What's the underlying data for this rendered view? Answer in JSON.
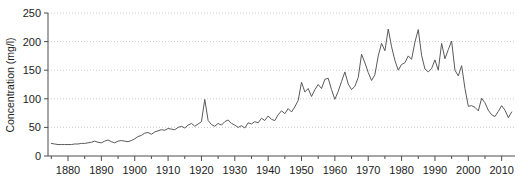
{
  "chart_data": {
    "type": "line",
    "title": "",
    "xlabel": "",
    "ylabel": "Concentration (mg/l)",
    "xlim": [
      1874,
      2014
    ],
    "ylim": [
      0,
      250
    ],
    "yticks": [
      0,
      50,
      100,
      150,
      200,
      250
    ],
    "ytick_labels": [
      "0",
      "50",
      "100",
      "150",
      "200",
      "250"
    ],
    "xticks": [
      1880,
      1890,
      1900,
      1910,
      1920,
      1930,
      1940,
      1950,
      1960,
      1970,
      1980,
      1990,
      2000,
      2010
    ],
    "xtick_labels": [
      "1880",
      "1890",
      "1900",
      "1910",
      "1920",
      "1930",
      "1940",
      "1950",
      "1960",
      "1970",
      "1980",
      "1990",
      "2000",
      "2010"
    ],
    "xminor_step": 5,
    "grid": "horizontal-dotted",
    "grid_color": "#cccccc",
    "legend": "none",
    "line_color": "#5a5a5a",
    "line_width": 1,
    "axis_color": "#4d4d4d",
    "background": "#ffffff",
    "x": [
      1875,
      1876,
      1877,
      1878,
      1879,
      1880,
      1881,
      1882,
      1883,
      1884,
      1885,
      1886,
      1887,
      1888,
      1889,
      1890,
      1891,
      1892,
      1893,
      1894,
      1895,
      1896,
      1897,
      1898,
      1899,
      1900,
      1901,
      1902,
      1903,
      1904,
      1905,
      1906,
      1907,
      1908,
      1909,
      1910,
      1911,
      1912,
      1913,
      1914,
      1915,
      1916,
      1917,
      1918,
      1919,
      1920,
      1921,
      1922,
      1923,
      1924,
      1925,
      1926,
      1927,
      1928,
      1929,
      1930,
      1931,
      1932,
      1933,
      1934,
      1935,
      1936,
      1937,
      1938,
      1939,
      1940,
      1941,
      1942,
      1943,
      1944,
      1945,
      1946,
      1947,
      1948,
      1949,
      1950,
      1951,
      1952,
      1953,
      1954,
      1955,
      1956,
      1957,
      1958,
      1959,
      1960,
      1961,
      1962,
      1963,
      1964,
      1965,
      1966,
      1967,
      1968,
      1969,
      1970,
      1971,
      1972,
      1973,
      1974,
      1975,
      1976,
      1977,
      1978,
      1979,
      1980,
      1981,
      1982,
      1983,
      1984,
      1985,
      1986,
      1987,
      1988,
      1989,
      1990,
      1991,
      1992,
      1993,
      1994,
      1995,
      1996,
      1997,
      1998,
      1999,
      2000,
      2001,
      2002,
      2003,
      2004,
      2005,
      2006,
      2007,
      2008,
      2009,
      2010,
      2011,
      2012,
      2013
    ],
    "values": [
      22,
      21,
      20,
      20,
      20,
      20,
      20,
      21,
      21,
      22,
      22,
      23,
      24,
      26,
      24,
      23,
      26,
      28,
      25,
      23,
      26,
      27,
      26,
      25,
      27,
      30,
      34,
      36,
      40,
      41,
      38,
      42,
      44,
      46,
      45,
      48,
      47,
      46,
      50,
      52,
      49,
      54,
      57,
      52,
      56,
      60,
      99,
      62,
      55,
      52,
      57,
      54,
      60,
      63,
      57,
      54,
      50,
      53,
      49,
      58,
      56,
      60,
      58,
      66,
      62,
      70,
      64,
      62,
      72,
      79,
      74,
      83,
      77,
      86,
      97,
      129,
      112,
      118,
      104,
      116,
      125,
      118,
      134,
      136,
      116,
      99,
      113,
      130,
      147,
      126,
      116,
      122,
      137,
      178,
      163,
      146,
      132,
      142,
      175,
      197,
      184,
      222,
      191,
      167,
      150,
      160,
      163,
      175,
      169,
      199,
      221,
      176,
      152,
      147,
      153,
      168,
      150,
      197,
      170,
      186,
      201,
      150,
      140,
      158,
      118,
      87,
      88,
      85,
      79,
      101,
      93,
      80,
      72,
      69,
      78,
      88,
      80,
      67,
      77
    ]
  },
  "axis": {
    "ylabel": "Concentration (mg/l)"
  }
}
